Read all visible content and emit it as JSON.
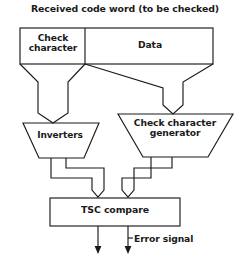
{
  "diagram": {
    "title": "Received code word (to be checked)",
    "type": "block-diagram",
    "stroke_color": "#1a1a1a",
    "background_color": "#ffffff",
    "blocks": [
      {
        "id": "check-character",
        "label": "Check\ncharacter",
        "shape": "rectangle"
      },
      {
        "id": "data",
        "label": "Data",
        "shape": "rectangle"
      },
      {
        "id": "inverters",
        "label": "Inverters",
        "shape": "trapezoid"
      },
      {
        "id": "check-character-generator",
        "label": "Check character\ngenerator",
        "shape": "trapezoid"
      },
      {
        "id": "tsc-compare",
        "label": "TSC compare",
        "shape": "rectangle"
      }
    ],
    "signals": [
      {
        "id": "error-signal",
        "label": "Error signal"
      }
    ],
    "outputs": {
      "arrow_count": 2
    }
  }
}
